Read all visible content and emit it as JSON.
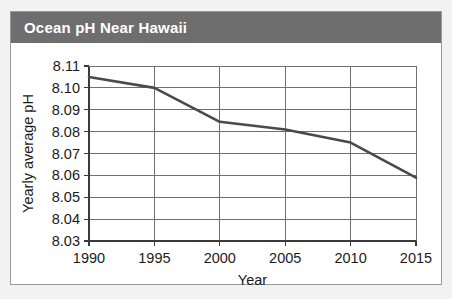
{
  "figure": {
    "title": "Ocean pH Near Hawaii",
    "title_bar_color": "#6e6e6e",
    "title_text_color": "#ffffff",
    "frame_border_color": "#9a9a9a",
    "page_background": "#f2f2f2",
    "plot_background": "#ffffff"
  },
  "chart_data": {
    "type": "line",
    "title": "Ocean pH Near Hawaii",
    "xlabel": "Year",
    "ylabel": "Yearly average pH",
    "x": [
      1990,
      1995,
      2000,
      2005,
      2010,
      2015
    ],
    "values": [
      8.105,
      8.1,
      8.0845,
      8.081,
      8.075,
      8.059
    ],
    "series": [
      {
        "name": "Yearly average pH",
        "color": "#4a4a4a",
        "values": [
          8.105,
          8.1,
          8.0845,
          8.081,
          8.075,
          8.059
        ]
      }
    ],
    "xlim": [
      1990,
      2015
    ],
    "ylim": [
      8.03,
      8.11
    ],
    "xticks": [
      1990,
      1995,
      2000,
      2005,
      2010,
      2015
    ],
    "xtick_labels": [
      "1990",
      "1995",
      "2000",
      "2005",
      "2010",
      "2015"
    ],
    "yticks": [
      8.03,
      8.04,
      8.05,
      8.06,
      8.07,
      8.08,
      8.09,
      8.1,
      8.11
    ],
    "ytick_labels": [
      "8.03",
      "8.04",
      "8.05",
      "8.06",
      "8.07",
      "8.08",
      "8.09",
      "8.10",
      "8.11"
    ],
    "grid": true,
    "grid_axes": "both",
    "legend": false,
    "markers": false,
    "line_color": "#4a4a4a"
  }
}
